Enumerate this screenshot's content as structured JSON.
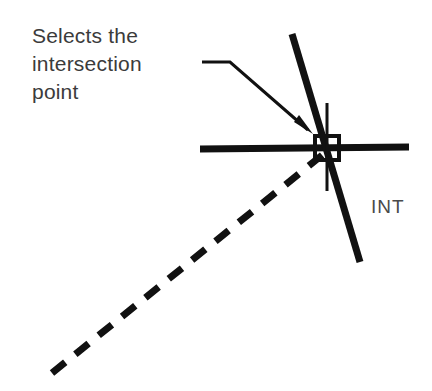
{
  "diagram": {
    "background_color": "#ffffff",
    "ink_color": "#111111",
    "text_color": "#3b3b3b",
    "annotation": {
      "text": "Selects the\nintersection\npoint",
      "lines": [
        "Selects the",
        "intersection",
        "point"
      ],
      "x": 32,
      "y": 22,
      "font_size": 21
    },
    "snap_label": {
      "text": "INT",
      "x": 371,
      "y": 196,
      "font_size": 19
    },
    "leader": {
      "name": "annotation-leader-arrow",
      "points": "202,62 230,62 310,131",
      "arrow_tip_x": 312,
      "arrow_tip_y": 133,
      "stroke_width": 3
    },
    "intersection_point": {
      "x": 327,
      "y": 148
    },
    "marker": {
      "shape": "square",
      "x": 315,
      "y": 136,
      "size": 24,
      "stroke_width": 4,
      "label": "intersection-snap-marker"
    },
    "crosshair": {
      "orientation": "vertical",
      "x": 327,
      "y1": 103,
      "y2": 191,
      "stroke_width": 3
    },
    "lines": [
      {
        "name": "horizontal-line",
        "style": "solid",
        "x1": 200,
        "y1": 149,
        "x2": 409,
        "y2": 147,
        "stroke_width": 7
      },
      {
        "name": "steep-diagonal-line",
        "style": "solid",
        "x1": 292,
        "y1": 34,
        "x2": 360,
        "y2": 262,
        "stroke_width": 7
      },
      {
        "name": "dashed-diagonal-line",
        "style": "dashed",
        "x1": 52,
        "y1": 373,
        "x2": 326,
        "y2": 152,
        "stroke_width": 7,
        "dash_pattern": "17 13"
      }
    ]
  }
}
